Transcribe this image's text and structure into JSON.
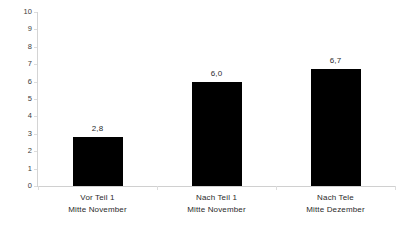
{
  "chart_data": {
    "type": "bar",
    "title": "",
    "subtitle": "",
    "xlabel": "",
    "ylabel": "",
    "categories": [
      {
        "line1": "Vor Teil 1",
        "line2": "Mitte November"
      },
      {
        "line1": "Nach Teil 1",
        "line2": "Mitte November"
      },
      {
        "line1": "Nach Tele",
        "line2": "Mitte Dezember"
      }
    ],
    "values": [
      2.8,
      6.0,
      6.7
    ],
    "value_labels": [
      "2,8",
      "6,0",
      "6,7"
    ],
    "ylim": [
      0,
      10
    ],
    "ytick_labels": [
      "10",
      "9",
      "8",
      "7",
      "6",
      "5",
      "4",
      "3",
      "2",
      "1",
      "0"
    ],
    "ytick_values": [
      10,
      9,
      8,
      7,
      6,
      5,
      4,
      3,
      2,
      1,
      0
    ],
    "grid": false,
    "legend": false,
    "legend_position": "none",
    "bar_color": "#000000",
    "axis_color": "#d0d0d0",
    "text_color": "#2b2b2b",
    "background_color": "#ffffff"
  }
}
